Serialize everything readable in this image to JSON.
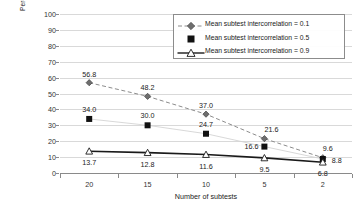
{
  "chart_data": {
    "type": "line",
    "title": "",
    "xlabel": "Number of subtests",
    "ylabel": "Percent of sample with one or more low scores",
    "ylabel_line1": "Percent of sample with one or more",
    "ylabel_line2": "low scores",
    "categories": [
      "20",
      "15",
      "10",
      "5",
      "2"
    ],
    "ylim": [
      0,
      100
    ],
    "y_ticks": [
      "0",
      "10",
      "20",
      "30",
      "40",
      "50",
      "60",
      "70",
      "80",
      "90",
      "100"
    ],
    "grid": true,
    "legend_position": "top-right",
    "series": [
      {
        "name": "Mean subtest intercorrelation = 0.1",
        "values": [
          56.8,
          48.2,
          37.0,
          21.6,
          9.6
        ],
        "labels": [
          "56.8",
          "48.2",
          "37.0",
          "21.6",
          "9.6"
        ],
        "marker": "diamond",
        "line_style": "dashed",
        "color": "#808080"
      },
      {
        "name": "Mean subtest intercorrelation = 0.5",
        "values": [
          34.0,
          30.0,
          24.7,
          16.6,
          8.8
        ],
        "labels": [
          "34.0",
          "30.0",
          "24.7",
          "16.6",
          "8.8"
        ],
        "marker": "square",
        "line_style": "thin-light",
        "color": "#cccccc"
      },
      {
        "name": "Mean subtest intercorrelation = 0.9",
        "values": [
          13.7,
          12.8,
          11.6,
          9.5,
          6.8
        ],
        "labels": [
          "13.7",
          "12.8",
          "11.6",
          "9.5",
          "6.8"
        ],
        "marker": "open-triangle",
        "line_style": "solid",
        "color": "#1a1a1a"
      }
    ]
  }
}
